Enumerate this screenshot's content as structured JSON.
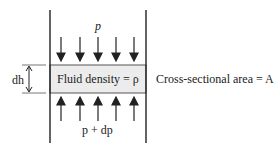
{
  "labels": {
    "top_pressure": "p",
    "bottom_pressure": "p + dp",
    "fluid_density": "Fluid density = ρ",
    "height": "dh",
    "area": "Cross-sectional area = A"
  },
  "colors": {
    "slab_fill": "#ececec",
    "line": "#222222"
  }
}
